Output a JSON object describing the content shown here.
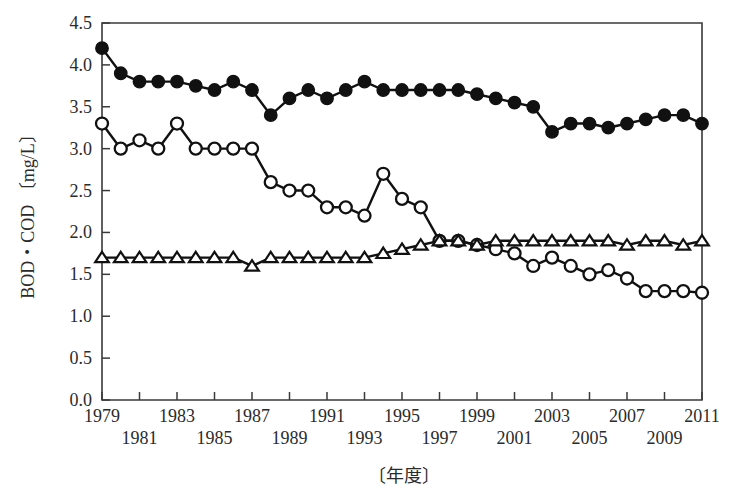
{
  "chart_data": {
    "type": "line",
    "title": "",
    "xlabel": "〔年度〕",
    "ylabel": "BOD・COD 〔mg/L〕",
    "x": [
      1979,
      1980,
      1981,
      1982,
      1983,
      1984,
      1985,
      1986,
      1987,
      1988,
      1989,
      1990,
      1991,
      1992,
      1993,
      1994,
      1995,
      1996,
      1997,
      1998,
      1999,
      2000,
      2001,
      2002,
      2003,
      2004,
      2005,
      2006,
      2007,
      2008,
      2009,
      2010,
      2011
    ],
    "xlim": [
      1979,
      2011
    ],
    "ylim": [
      0.0,
      4.5
    ],
    "yticks": [
      "0.0",
      "0.5",
      "1.0",
      "1.5",
      "2.0",
      "2.5",
      "3.0",
      "3.5",
      "4.0",
      "4.5"
    ],
    "ytick_values": [
      0.0,
      0.5,
      1.0,
      1.5,
      2.0,
      2.5,
      3.0,
      3.5,
      4.0,
      4.5
    ],
    "xticks_upper": [
      "1979",
      "1983",
      "1987",
      "1991",
      "1995",
      "1999",
      "2003",
      "2007",
      "2011"
    ],
    "xticks_lower": [
      "1981",
      "1985",
      "1989",
      "1993",
      "1997",
      "2001",
      "2005",
      "2009"
    ],
    "xtick_upper_values": [
      1979,
      1983,
      1987,
      1991,
      1995,
      1999,
      2003,
      2007,
      2011
    ],
    "xtick_lower_values": [
      1981,
      1985,
      1989,
      1993,
      1997,
      2001,
      2005,
      2009
    ],
    "grid": false,
    "legend_position": "none",
    "series": [
      {
        "name": "filled-circle-series",
        "marker": "filled-circle",
        "color": "#111111",
        "values": [
          4.2,
          3.9,
          3.8,
          3.8,
          3.8,
          3.75,
          3.7,
          3.8,
          3.7,
          3.4,
          3.6,
          3.7,
          3.6,
          3.7,
          3.8,
          3.7,
          3.7,
          3.7,
          3.7,
          3.7,
          3.65,
          3.6,
          3.55,
          3.5,
          3.2,
          3.3,
          3.3,
          3.25,
          3.3,
          3.35,
          3.4,
          3.4,
          3.3
        ]
      },
      {
        "name": "open-circle-series",
        "marker": "open-circle",
        "color": "#111111",
        "values": [
          3.3,
          3.0,
          3.1,
          3.0,
          3.3,
          3.0,
          3.0,
          3.0,
          3.0,
          2.6,
          2.5,
          2.5,
          2.3,
          2.3,
          2.2,
          2.7,
          2.4,
          2.3,
          1.9,
          1.9,
          1.85,
          1.8,
          1.75,
          1.6,
          1.7,
          1.6,
          1.5,
          1.55,
          1.45,
          1.3,
          1.3,
          1.3,
          1.28
        ]
      },
      {
        "name": "open-triangle-series",
        "marker": "open-triangle",
        "color": "#111111",
        "values": [
          1.7,
          1.7,
          1.7,
          1.7,
          1.7,
          1.7,
          1.7,
          1.7,
          1.6,
          1.7,
          1.7,
          1.7,
          1.7,
          1.7,
          1.7,
          1.75,
          1.8,
          1.85,
          1.9,
          1.9,
          1.85,
          1.9,
          1.9,
          1.9,
          1.9,
          1.9,
          1.9,
          1.9,
          1.85,
          1.9,
          1.9,
          1.85,
          1.9
        ]
      }
    ]
  },
  "plot": {
    "left": 102,
    "right": 702,
    "top": 23,
    "bottom": 400
  }
}
